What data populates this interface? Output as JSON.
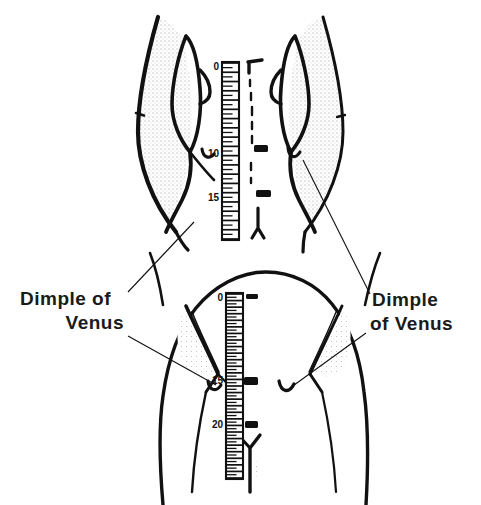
{
  "document": {
    "kind": "anatomical-line-drawing",
    "background_color": "#ffffff",
    "ink_color": "#111111",
    "stipple_color": "#9a9a9a"
  },
  "labels": {
    "left": {
      "name": "dimple-of-venus-left",
      "line1": "Dimple of",
      "line2": "Venus",
      "align": "right"
    },
    "right": {
      "name": "dimple-of-venus-right",
      "line1": "Dimple",
      "line2": "of Venus",
      "align": "left"
    }
  },
  "figures": [
    {
      "id": "upper-figure",
      "caption_absent": true,
      "description": "Close-up posterior view of the sacral region, left and right halves, with centimetre ruler along the midline",
      "ruler": {
        "name": "upper-ruler",
        "unit": "cm",
        "tick_labels": [
          "0",
          "10",
          "15"
        ],
        "tick_label_values": [
          0,
          10,
          15
        ],
        "range_start": 0,
        "range_end": 19,
        "minor_tick_count": 38
      },
      "midline_marks": {
        "dashed_line": true,
        "spinous_process_marks": 2,
        "top_hook_mark": true,
        "coccyx_mark": true
      },
      "dimple_markers": [
        "left",
        "right"
      ]
    },
    {
      "id": "lower-figure",
      "caption_absent": true,
      "description": "Posterior view of the lower back and buttocks with centimetre ruler along the spine",
      "ruler": {
        "name": "lower-ruler",
        "unit": "cm",
        "tick_labels": [
          "0",
          "15",
          "20"
        ],
        "tick_label_values": [
          0,
          15,
          20
        ],
        "range_start": 0,
        "range_end": 28,
        "minor_tick_count": 56
      },
      "midline_marks": {
        "dashed_line": false,
        "spinous_process_marks": 3,
        "gluteal_cleft_mark": true
      },
      "dimple_markers": [
        "left",
        "right"
      ]
    }
  ],
  "leader_lines": [
    {
      "name": "leader-upper-left",
      "from": "upper-figure-left-dimple",
      "to": "label-left"
    },
    {
      "name": "leader-upper-right",
      "from": "upper-figure-right-dimple",
      "to": "label-right"
    },
    {
      "name": "leader-lower-left",
      "from": "lower-figure-left-dimple",
      "to": "label-left"
    },
    {
      "name": "leader-lower-right",
      "from": "lower-figure-right-dimple",
      "to": "label-right"
    }
  ]
}
